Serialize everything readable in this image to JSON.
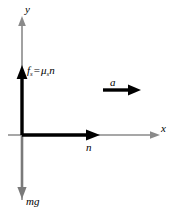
{
  "figure": {
    "type": "free-body-diagram",
    "background_color": "#ffffff",
    "axis_color": "#8a8a8a",
    "force_color": "#000000",
    "weight_color": "#7a7a7a",
    "axes": {
      "x_label": "x",
      "y_label": "y",
      "origin": {
        "x": 22,
        "y": 135
      }
    },
    "vectors": [
      {
        "key": "friction",
        "symbol": "f",
        "subscript": "s",
        "operator": "=",
        "expression_symbol": "μ",
        "expression_subscript": "s",
        "expression_tail": "n",
        "label_text": "f_s = μ_s n",
        "direction": "up",
        "color": "#000000",
        "thick": true
      },
      {
        "key": "normal",
        "label_text": "n",
        "direction": "right",
        "color": "#000000",
        "thick": true
      },
      {
        "key": "weight",
        "label_text": "mg",
        "direction": "down",
        "color": "#7a7a7a",
        "thick": false
      },
      {
        "key": "acceleration",
        "label_text": "a",
        "direction": "right",
        "color": "#000000",
        "thick": true
      }
    ]
  }
}
